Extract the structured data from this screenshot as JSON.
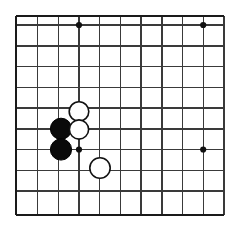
{
  "figure": {
    "kind": "go-board-diagram",
    "width": 227,
    "height": 232,
    "background_color": "#ffffff"
  },
  "board": {
    "line_color": "#3a3a3a",
    "edge_color": "#1a1a1a",
    "line_width": 1.4,
    "edge_width": 2.6,
    "spacing": 20.7,
    "origin_x": 16,
    "origin_y": 25,
    "vertical_lines_x": [
      16,
      37.5,
      58.2,
      79,
      99.7,
      120.4,
      141.1,
      161.8,
      182.5,
      203.2,
      224
    ],
    "horizontal_lines_y": [
      16,
      25,
      46,
      66.7,
      87.4,
      108.1,
      128.8,
      149.5,
      170.2,
      190.9,
      215
    ],
    "edges": {
      "left_x": 16,
      "top_y": 16,
      "bottom_y": 215,
      "right_open": true
    }
  },
  "star_points": [
    {
      "name": "hoshi-top-left",
      "x": 79,
      "y": 25,
      "radius": 3.1
    },
    {
      "name": "hoshi-top-right",
      "x": 203.2,
      "y": 25,
      "radius": 3.1
    },
    {
      "name": "hoshi-center-left",
      "x": 79,
      "y": 149.5,
      "radius": 3.1
    },
    {
      "name": "hoshi-center-right",
      "x": 203.2,
      "y": 149.5,
      "radius": 3.1
    }
  ],
  "stones": [
    {
      "name": "black-stone-upper",
      "color": "black",
      "x": 61,
      "y": 128.8,
      "radius": 10.6
    },
    {
      "name": "black-stone-lower",
      "color": "black",
      "x": 61,
      "y": 149.5,
      "radius": 10.6
    },
    {
      "name": "white-stone-upper",
      "color": "white",
      "x": 79,
      "y": 111.5,
      "radius": 9.8
    },
    {
      "name": "white-stone-middle",
      "color": "white",
      "x": 79,
      "y": 129.5,
      "radius": 9.6
    },
    {
      "name": "white-stone-lower",
      "color": "white",
      "x": 100,
      "y": 168,
      "radius": 10.2
    }
  ],
  "counts": {
    "black_stones": 2,
    "white_stones": 3,
    "star_points": 4
  }
}
